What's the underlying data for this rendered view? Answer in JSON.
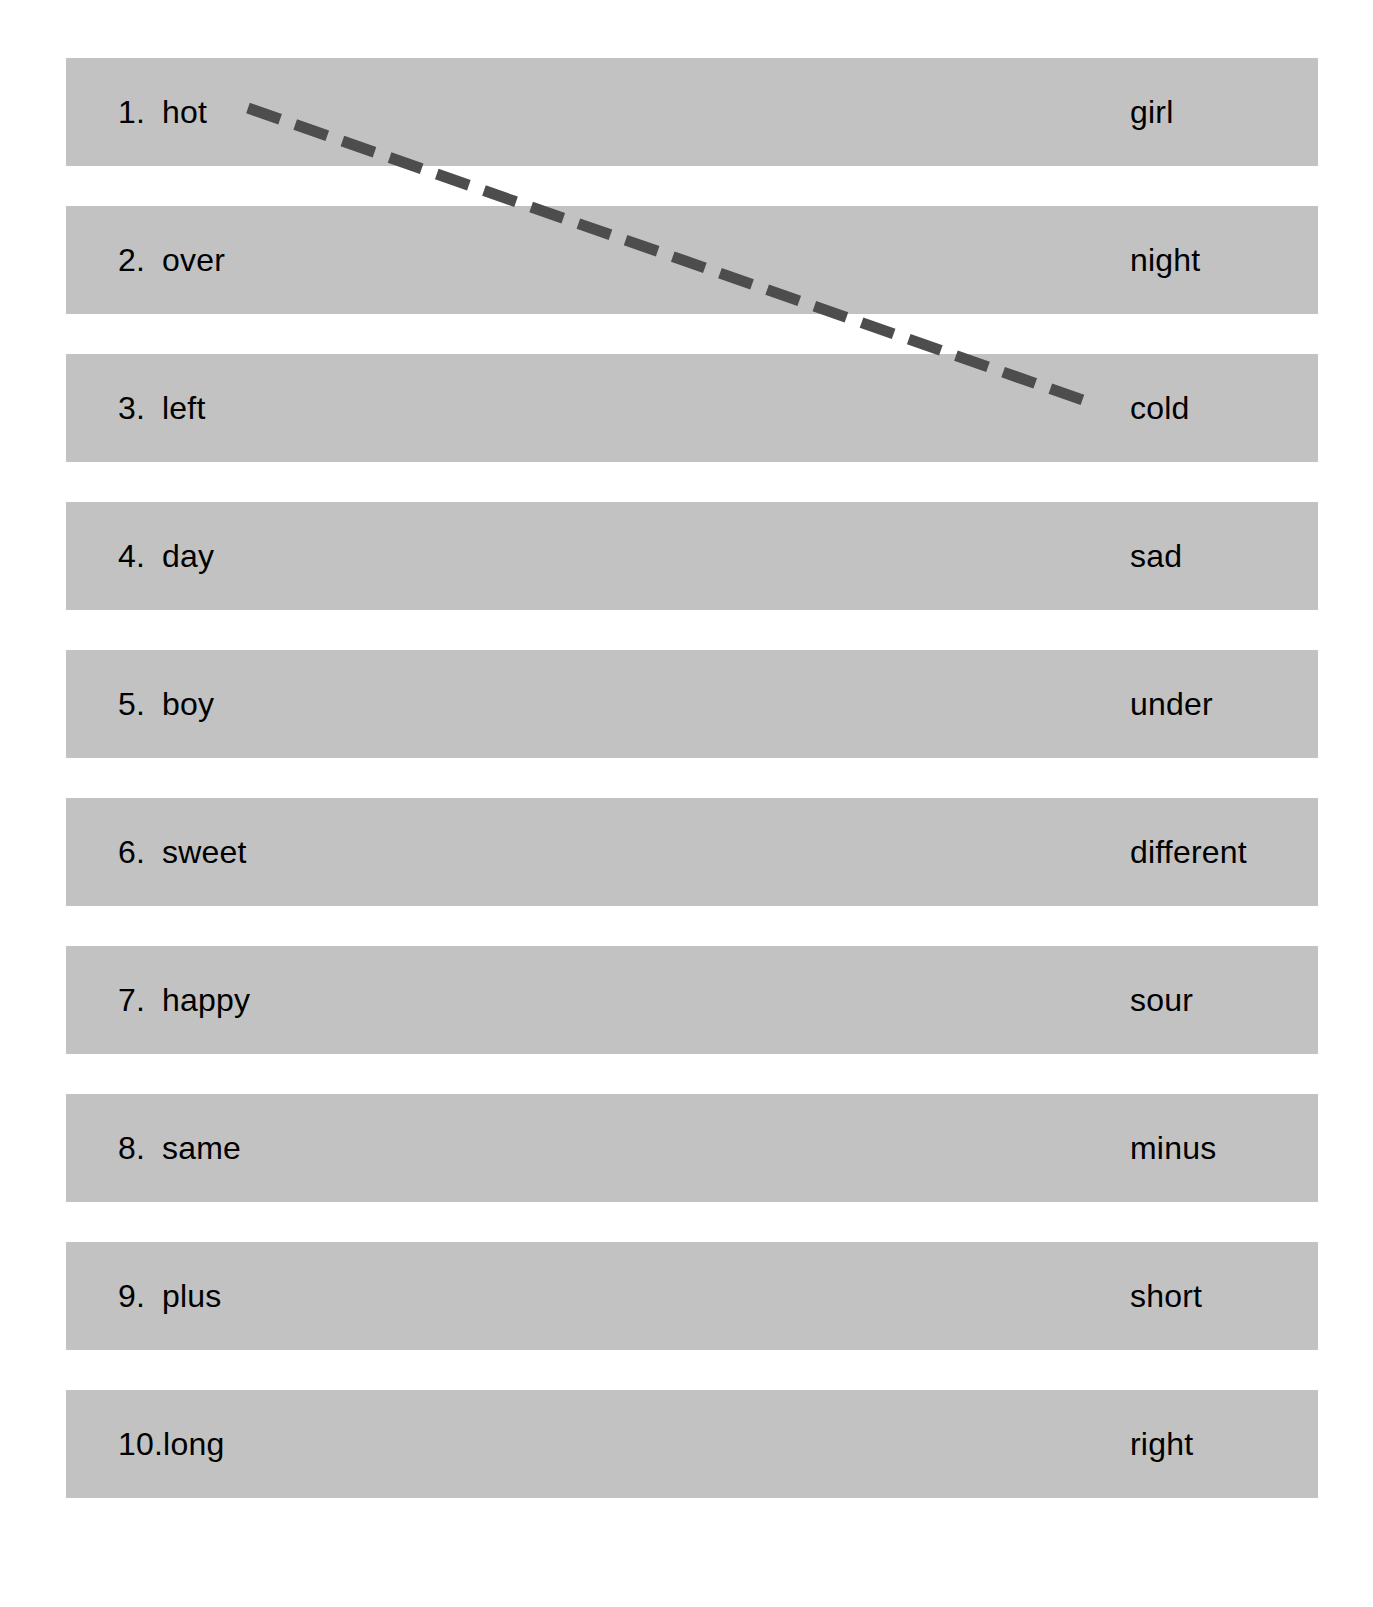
{
  "page": {
    "width": 1373,
    "height": 1607,
    "background_color": "#ffffff",
    "band_color": "#c2c2c2",
    "text_color": "#000000",
    "line_color": "#4d4d4d"
  },
  "worksheet": {
    "rows": [
      {
        "number": "1.",
        "left_word": "hot",
        "right_word": "girl"
      },
      {
        "number": "2.",
        "left_word": "over",
        "right_word": "night"
      },
      {
        "number": "3.",
        "left_word": "left",
        "right_word": "cold"
      },
      {
        "number": "4.",
        "left_word": "day",
        "right_word": "sad"
      },
      {
        "number": "5.",
        "left_word": "boy",
        "right_word": "under"
      },
      {
        "number": "6.",
        "left_word": "sweet",
        "right_word": "different"
      },
      {
        "number": "7.",
        "left_word": "happy",
        "right_word": "sour"
      },
      {
        "number": "8.",
        "left_word": "same",
        "right_word": "minus"
      },
      {
        "number": "9.",
        "left_word": "plus",
        "right_word": "short"
      },
      {
        "number": "10.",
        "left_word": "long",
        "right_word": "right"
      }
    ],
    "connections": [
      {
        "name": "hot-to-cold",
        "from_word": "hot",
        "to_word": "cold",
        "x1": 248,
        "y1": 108,
        "x2": 1097,
        "y2": 405,
        "stroke": "#4d4d4d",
        "stroke_width": 11,
        "dash": "34 16"
      }
    ]
  }
}
